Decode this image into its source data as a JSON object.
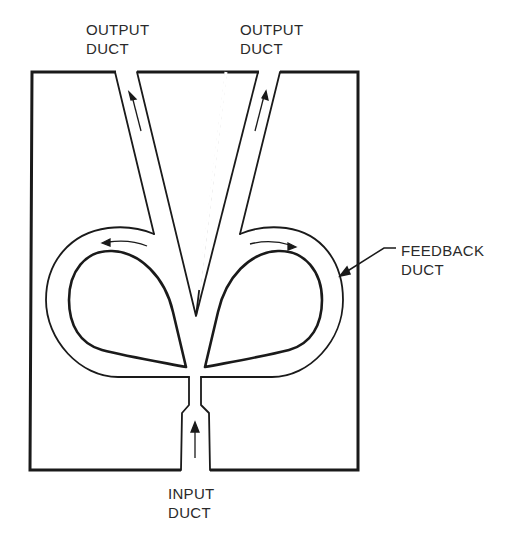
{
  "diagram": {
    "type": "fluidic-amplifier",
    "labels": {
      "output_left": {
        "line1": "OUTPUT",
        "line2": "DUCT"
      },
      "output_right": {
        "line1": "OUTPUT",
        "line2": "DUCT"
      },
      "feedback": {
        "line1": "FEEDBACK",
        "line2": "DUCT"
      },
      "input": {
        "line1": "INPUT",
        "line2": "DUCT"
      }
    },
    "colors": {
      "stroke": "#1a1a1a",
      "background": "#ffffff",
      "text": "#2a2a2a"
    },
    "flow_arrows": [
      "left-output-up",
      "right-output-up",
      "left-feedback-ccw",
      "right-feedback-cw",
      "input-up"
    ]
  }
}
